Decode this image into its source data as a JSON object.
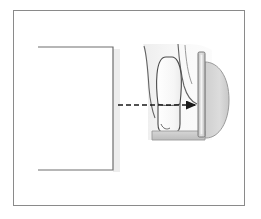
{
  "figure": {
    "frame": {
      "x": 13,
      "y": 10,
      "width": 232,
      "height": 196,
      "border_color": "#8a8a8a",
      "background_color": "#ffffff"
    },
    "elements": [
      {
        "id": "cone",
        "label": "x-ray tube cone",
        "shape": "open-rectangle",
        "x": 38,
        "y": 47,
        "width": 75,
        "height": 123,
        "stroke_color": "#6e6e6e",
        "fill_color": "#ffffff",
        "open_side": "left"
      },
      {
        "id": "cone-shadow",
        "label": "cone drop shadow",
        "shape": "vertical-band",
        "x": 113,
        "y": 49,
        "width": 7,
        "height": 123,
        "fill_color": "#ededed"
      },
      {
        "id": "beam-arrow",
        "label": "central x-ray beam direction arrow",
        "shape": "dashed-arrow",
        "x1": 118,
        "y1": 105,
        "x2": 198,
        "y2": 105,
        "stroke_color": "#1a1a1a",
        "dash": "5,3",
        "arrowhead": "right"
      },
      {
        "id": "gingiva",
        "label": "gingiva and alveolar outline",
        "shape": "curve",
        "stroke_color": "#555555",
        "fill_color": "#f0f0f0"
      },
      {
        "id": "tooth",
        "label": "tooth with root and crown",
        "shape": "tooth-outline",
        "x": 157,
        "y": 57,
        "width": 24,
        "height": 75,
        "stroke_color": "#4a4a4a",
        "fill_color": "#fbfbfb"
      },
      {
        "id": "sensor",
        "label": "intraoral image receptor sensor",
        "shape": "vertical-bar",
        "x": 198,
        "y": 52,
        "width": 7,
        "height": 85,
        "stroke_color": "#7a7a7a",
        "fill_color": "#d3d3d3"
      },
      {
        "id": "tongue",
        "label": "tongue",
        "shape": "rounded-lobe",
        "x": 204,
        "y": 62,
        "width": 26,
        "height": 76,
        "stroke_color": "#9a9a9a",
        "fill_color": "#d8d8d8"
      },
      {
        "id": "mouth-floor",
        "label": "floor of the mouth",
        "shape": "horizontal-bar",
        "x": 152,
        "y": 131,
        "width": 58,
        "height": 9,
        "stroke_color": "#9a9a9a",
        "fill_color": "#c6c6c6"
      }
    ],
    "colors": {
      "frame_border": "#8a8a8a",
      "outline_dark": "#4a4a4a",
      "outline_mid": "#7a7a7a",
      "fill_light": "#f0f0f0",
      "fill_gray": "#d3d3d3",
      "arrow": "#1a1a1a",
      "shadow": "#ededed",
      "background": "#ffffff"
    }
  }
}
